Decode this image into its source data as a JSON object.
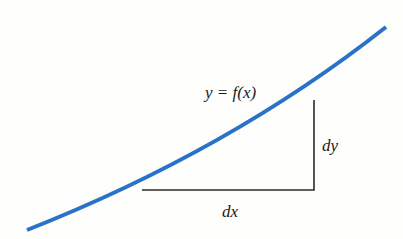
{
  "diagram": {
    "type": "calculus-differential-triangle",
    "curve_label": "y = f(x)",
    "dx_label": "dx",
    "dy_label": "dy",
    "colors": {
      "curve": "#2a72c8",
      "triangle": "#2b2b2b",
      "background": "#fefefc",
      "text": "#1a1a1a"
    },
    "curve": {
      "start": [
        27,
        230
      ],
      "control": [
        230,
        150
      ],
      "end": [
        386,
        27
      ]
    },
    "triangle": {
      "base_left": [
        142,
        190
      ],
      "corner": [
        314,
        190
      ],
      "top": [
        314,
        100
      ]
    }
  }
}
